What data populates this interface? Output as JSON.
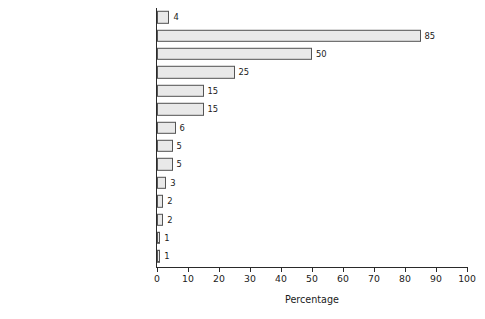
{
  "chart_data": {
    "type": "bar",
    "orientation": "horizontal",
    "title": "",
    "xlabel": "Percentage",
    "ylabel": "",
    "xlim": [
      0,
      100
    ],
    "xticks": [
      0,
      10,
      20,
      30,
      40,
      50,
      60,
      70,
      80,
      90,
      100
    ],
    "grid": false,
    "legend": false,
    "categories": [
      "Canada",
      "Nunavut",
      "Northwest Territories",
      "Yukon Territory",
      "Manitoba",
      "Saskatchewan",
      "Alberta",
      "British Columbia",
      "Newfoundland and Labrador",
      "Nova Scotia",
      "New Brunswick",
      "Ontario",
      "Quebec",
      "Prince Edward Island"
    ],
    "values": [
      4,
      85,
      50,
      25,
      15,
      15,
      6,
      5,
      5,
      3,
      2,
      2,
      1,
      1
    ],
    "value_labels": [
      "4",
      "85",
      "50",
      "25",
      "15",
      "15",
      "6",
      "5",
      "5",
      "3",
      "2",
      "2",
      "1",
      "1"
    ],
    "bar_fill": "#e9e9e9",
    "bar_stroke": "#555555",
    "axis_color": "#2a2a2a",
    "text_color": "#1b1b1b",
    "background": "#ffffff"
  }
}
